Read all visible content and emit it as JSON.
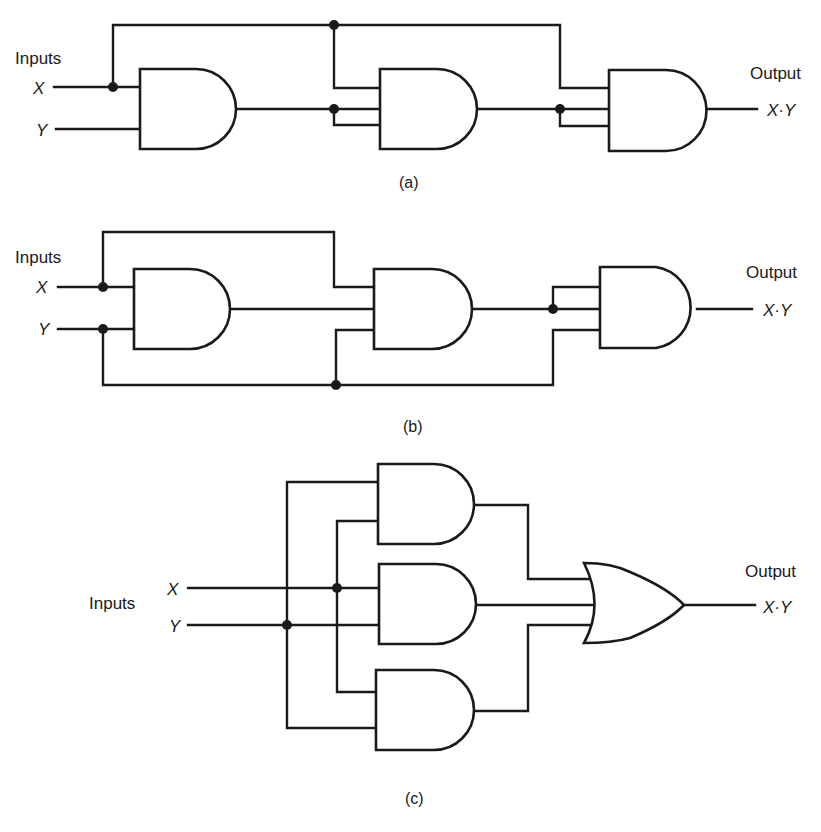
{
  "figures": {
    "a": {
      "caption": "(a)",
      "inputs_label": "Inputs",
      "input_x": "X",
      "input_y": "Y",
      "output_label": "Output",
      "output_expr": "X·Y",
      "gates": [
        "AND",
        "AND",
        "AND"
      ]
    },
    "b": {
      "caption": "(b)",
      "inputs_label": "Inputs",
      "input_x": "X",
      "input_y": "Y",
      "output_label": "Output",
      "output_expr": "X·Y",
      "gates": [
        "AND",
        "AND",
        "AND"
      ]
    },
    "c": {
      "caption": "(c)",
      "inputs_label": "Inputs",
      "input_x": "X",
      "input_y": "Y",
      "output_label": "Output",
      "output_expr": "X·Y",
      "gates": [
        "AND",
        "AND",
        "AND",
        "OR"
      ]
    }
  },
  "colors": {
    "ink": "#1a1a1a",
    "background": "#ffffff"
  }
}
